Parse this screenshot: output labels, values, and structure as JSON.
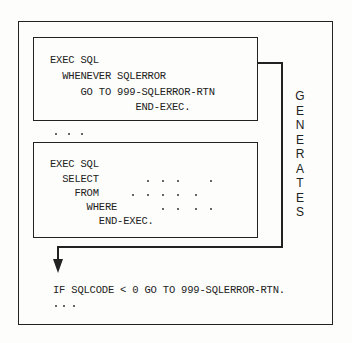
{
  "diagram": {
    "box1": {
      "lines": [
        "EXEC SQL",
        "  WHENEVER SQLERROR",
        "     GO TO 999-SQLERROR-RTN",
        "              END-EXEC."
      ]
    },
    "ellipsis1": "...",
    "box2": {
      "lines": [
        "EXEC SQL",
        "  SELECT",
        "    FROM",
        "      WHERE",
        "        END-EXEC."
      ]
    },
    "arrow_label": "GENERATES",
    "arrow_label_letters": [
      "G",
      "E",
      "N",
      "E",
      "R",
      "A",
      "T",
      "E",
      "S"
    ],
    "generated_code": {
      "line1": "IF SQLCODE < 0 GO TO 999-SQLERROR-RTN.",
      "ellipsis": "..."
    },
    "colors": {
      "line": "#222222",
      "background": "#fdfdfb"
    }
  }
}
